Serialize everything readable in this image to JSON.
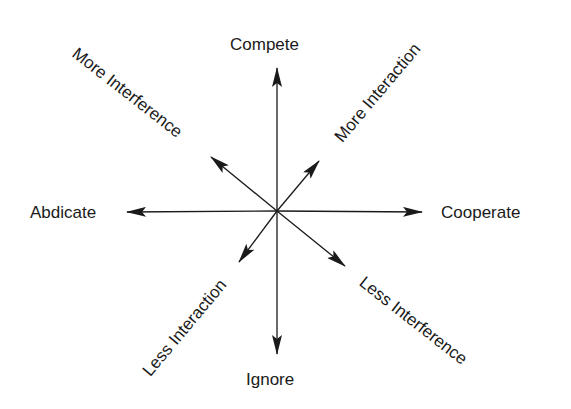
{
  "diagram": {
    "title": "",
    "center": {
      "x": 277,
      "y": 211
    },
    "line_color": "#1a1a1a",
    "axes": [
      {
        "id": "compete",
        "label": "Compete",
        "direction": "up",
        "tip": {
          "x": 277,
          "y": 68
        }
      },
      {
        "id": "ignore",
        "label": "Ignore",
        "direction": "down",
        "tip": {
          "x": 277,
          "y": 354
        }
      },
      {
        "id": "abdicate",
        "label": "Abdicate",
        "direction": "left",
        "tip": {
          "x": 127,
          "y": 212
        }
      },
      {
        "id": "cooperate",
        "label": "Cooperate",
        "direction": "right",
        "tip": {
          "x": 422,
          "y": 212
        }
      },
      {
        "id": "more-interference",
        "label": "More Interference",
        "direction": "up-left",
        "tip": {
          "x": 211,
          "y": 157
        }
      },
      {
        "id": "more-interaction",
        "label": "More Interaction",
        "direction": "up-right",
        "tip": {
          "x": 319,
          "y": 161
        }
      },
      {
        "id": "less-interaction",
        "label": "Less Interaction",
        "direction": "down-left",
        "tip": {
          "x": 239,
          "y": 262
        }
      },
      {
        "id": "less-interference",
        "label": "Less Interference",
        "direction": "down-right",
        "tip": {
          "x": 345,
          "y": 266
        }
      }
    ]
  }
}
